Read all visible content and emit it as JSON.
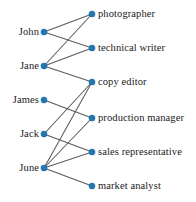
{
  "figure": {
    "node_color": "#1f77b4",
    "edge_color": "#5a5a5a",
    "background_color": "#ffffff",
    "width": 196,
    "height": 202
  },
  "left_column": {
    "name": "people",
    "nodes": [
      {
        "id": "john",
        "label": "John",
        "x": 44,
        "y": 32,
        "label_x": 39,
        "label_y": 32
      },
      {
        "id": "jane",
        "label": "Jane",
        "x": 44,
        "y": 66,
        "label_x": 39,
        "label_y": 66
      },
      {
        "id": "james",
        "label": "James",
        "x": 44,
        "y": 100,
        "label_x": 39,
        "label_y": 100
      },
      {
        "id": "jack",
        "label": "Jack",
        "x": 44,
        "y": 134,
        "label_x": 39,
        "label_y": 134
      },
      {
        "id": "june",
        "label": "June",
        "x": 44,
        "y": 168,
        "label_x": 39,
        "label_y": 168
      }
    ]
  },
  "right_column": {
    "name": "jobs",
    "nodes": [
      {
        "id": "photographer",
        "label": "photographer",
        "x": 92,
        "y": 14,
        "label_x": 98,
        "label_y": 14
      },
      {
        "id": "technical-writer",
        "label": "technical writer",
        "x": 92,
        "y": 48,
        "label_x": 98,
        "label_y": 48
      },
      {
        "id": "copy-editor",
        "label": "copy editor",
        "x": 92,
        "y": 82,
        "label_x": 98,
        "label_y": 82
      },
      {
        "id": "production-manager",
        "label": "production manager",
        "x": 92,
        "y": 118,
        "label_x": 98,
        "label_y": 118
      },
      {
        "id": "sales-representative",
        "label": "sales representative",
        "x": 92,
        "y": 152,
        "label_x": 98,
        "label_y": 152
      },
      {
        "id": "market-analyst",
        "label": "market analyst",
        "x": 92,
        "y": 186,
        "label_x": 98,
        "label_y": 186
      }
    ]
  },
  "edges": [
    {
      "from": "john",
      "to": "photographer",
      "x1": 44,
      "y1": 32,
      "x2": 92,
      "y2": 14
    },
    {
      "from": "john",
      "to": "technical-writer",
      "x1": 44,
      "y1": 32,
      "x2": 92,
      "y2": 48
    },
    {
      "from": "jane",
      "to": "photographer",
      "x1": 44,
      "y1": 66,
      "x2": 92,
      "y2": 14
    },
    {
      "from": "jane",
      "to": "technical-writer",
      "x1": 44,
      "y1": 66,
      "x2": 92,
      "y2": 48
    },
    {
      "from": "jane",
      "to": "copy-editor",
      "x1": 44,
      "y1": 66,
      "x2": 92,
      "y2": 82
    },
    {
      "from": "james",
      "to": "production-manager",
      "x1": 44,
      "y1": 100,
      "x2": 92,
      "y2": 118
    },
    {
      "from": "jack",
      "to": "copy-editor",
      "x1": 44,
      "y1": 134,
      "x2": 92,
      "y2": 82
    },
    {
      "from": "jack",
      "to": "sales-representative",
      "x1": 44,
      "y1": 134,
      "x2": 92,
      "y2": 152
    },
    {
      "from": "june",
      "to": "copy-editor",
      "x1": 44,
      "y1": 168,
      "x2": 92,
      "y2": 82
    },
    {
      "from": "june",
      "to": "production-manager",
      "x1": 44,
      "y1": 168,
      "x2": 92,
      "y2": 118
    },
    {
      "from": "june",
      "to": "sales-representative",
      "x1": 44,
      "y1": 168,
      "x2": 92,
      "y2": 152
    },
    {
      "from": "june",
      "to": "market-analyst",
      "x1": 44,
      "y1": 168,
      "x2": 92,
      "y2": 186
    }
  ]
}
